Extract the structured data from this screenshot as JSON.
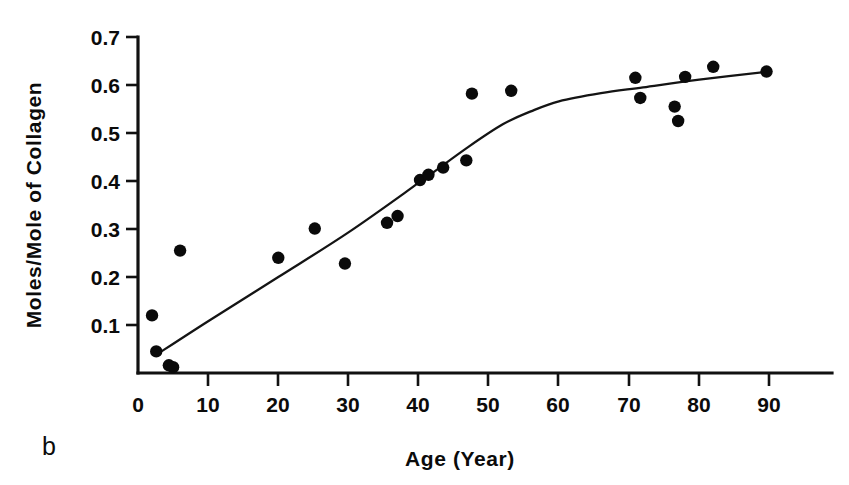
{
  "figure": {
    "panel_label": "b",
    "background_color": "#ffffff",
    "ink_color": "#0b0b0b"
  },
  "chart_data": {
    "type": "scatter",
    "title": "",
    "xlabel": "Age  (Year)",
    "ylabel": "Moles/Mole of Collagen",
    "xlim": [
      0,
      97
    ],
    "ylim": [
      0,
      0.7
    ],
    "grid": false,
    "legend": null,
    "xticks": [
      0,
      10,
      20,
      30,
      40,
      50,
      60,
      70,
      80,
      90
    ],
    "xtick_labels": [
      "0",
      "10",
      "20",
      "30",
      "40",
      "50",
      "60",
      "70",
      "80",
      "90"
    ],
    "yticks": [
      0.1,
      0.2,
      0.3,
      0.4,
      0.5,
      0.6,
      0.7
    ],
    "ytick_labels": [
      "0.1",
      "0.2",
      "0.3",
      "0.4",
      "0.5",
      "0.6",
      "0.7"
    ],
    "marker": "filled-circle",
    "marker_color": "#0a0a0a",
    "points": [
      {
        "x": 2.0,
        "y": 0.12
      },
      {
        "x": 2.6,
        "y": 0.045
      },
      {
        "x": 4.4,
        "y": 0.016
      },
      {
        "x": 5.0,
        "y": 0.012
      },
      {
        "x": 6.0,
        "y": 0.255
      },
      {
        "x": 20.0,
        "y": 0.24
      },
      {
        "x": 25.2,
        "y": 0.301
      },
      {
        "x": 29.5,
        "y": 0.228
      },
      {
        "x": 35.5,
        "y": 0.313
      },
      {
        "x": 37.0,
        "y": 0.327
      },
      {
        "x": 40.2,
        "y": 0.402
      },
      {
        "x": 41.4,
        "y": 0.413
      },
      {
        "x": 43.5,
        "y": 0.428
      },
      {
        "x": 46.8,
        "y": 0.443
      },
      {
        "x": 47.6,
        "y": 0.582
      },
      {
        "x": 53.2,
        "y": 0.588
      },
      {
        "x": 70.9,
        "y": 0.615
      },
      {
        "x": 71.6,
        "y": 0.573
      },
      {
        "x": 76.5,
        "y": 0.555
      },
      {
        "x": 77.0,
        "y": 0.525
      },
      {
        "x": 78.0,
        "y": 0.617
      },
      {
        "x": 82.0,
        "y": 0.638
      },
      {
        "x": 89.6,
        "y": 0.628
      }
    ],
    "fit_curve": {
      "name": "fitted trend",
      "style": "bilinear-with-rounded-knee",
      "knee_x": 55,
      "knee_y": 0.545,
      "x": [
        2.5,
        10,
        20,
        30,
        40,
        47,
        52,
        56,
        60,
        66,
        72,
        80,
        90
      ],
      "y": [
        0.037,
        0.108,
        0.2,
        0.293,
        0.396,
        0.47,
        0.518,
        0.545,
        0.566,
        0.583,
        0.595,
        0.611,
        0.628
      ]
    }
  }
}
